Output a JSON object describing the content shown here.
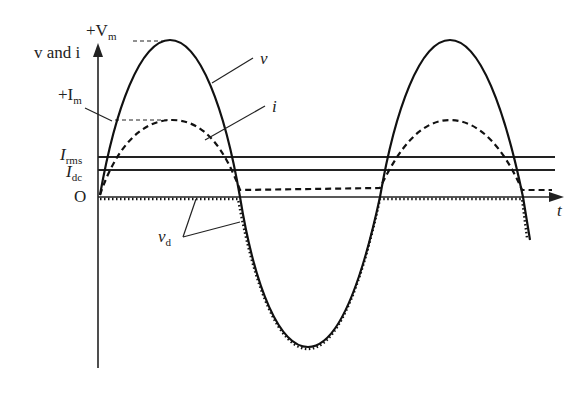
{
  "diagram": {
    "labels": {
      "y_axis": "v and i",
      "vm_prefix": "+V",
      "vm_sub": "m",
      "im_prefix": "+I",
      "im_sub": "m",
      "irms_main": "I",
      "irms_sub": "rms",
      "idc_main": "I",
      "idc_sub": "dc",
      "origin": "O",
      "t_axis": "t",
      "v_curve": "v",
      "i_curve": "i",
      "vd_main": "v",
      "vd_sub": "d"
    },
    "colors": {
      "line": "#111111",
      "background": "#ffffff"
    }
  }
}
